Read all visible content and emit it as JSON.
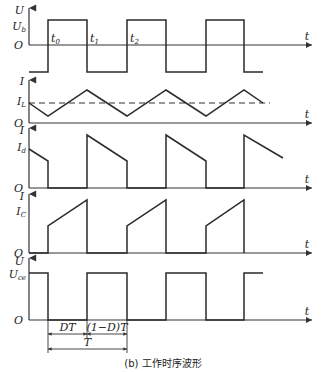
{
  "caption": "(b) 工作时序波形",
  "colors": {
    "line": "#2a2a2a",
    "background": "#ffffff"
  },
  "axis": {
    "x": 29,
    "arrow_end_x": 312,
    "time_label": "t"
  },
  "time_marks": {
    "t0": {
      "label": "t",
      "sub": "0",
      "x": 48
    },
    "t1": {
      "label": "t",
      "sub": "1",
      "x": 87
    },
    "t2": {
      "label": "t",
      "sub": "2",
      "x": 127
    }
  },
  "panels": [
    {
      "id": "U_b",
      "y_label": "U",
      "level_label": "U",
      "level_sub": "b",
      "origin_label": "O",
      "top": 8,
      "zero_y": 45,
      "label_y": 14,
      "level_y": 30,
      "points": [
        [
          29,
          72
        ],
        [
          48,
          72
        ],
        [
          48,
          20
        ],
        [
          87,
          20
        ],
        [
          87,
          72
        ],
        [
          127,
          72
        ],
        [
          127,
          20
        ],
        [
          166,
          20
        ],
        [
          166,
          72
        ],
        [
          206,
          72
        ],
        [
          206,
          20
        ],
        [
          244,
          20
        ],
        [
          244,
          72
        ],
        [
          263,
          72
        ]
      ]
    },
    {
      "id": "I_L",
      "y_label": "I",
      "level_label": "I",
      "level_sub": "L",
      "origin_label": "O",
      "top": 80,
      "zero_y": 123,
      "label_y": 85,
      "level_y": 105,
      "dashed_y": 103,
      "dashed_x_end": 270,
      "points": [
        [
          29,
          103
        ],
        [
          48,
          116
        ],
        [
          87,
          90
        ],
        [
          127,
          116
        ],
        [
          166,
          90
        ],
        [
          206,
          116
        ],
        [
          244,
          90
        ],
        [
          263,
          103
        ]
      ]
    },
    {
      "id": "I_d",
      "y_label": "I",
      "level_label": "I",
      "level_sub": "d",
      "origin_label": "O",
      "top": 128,
      "zero_y": 188,
      "label_y": 134,
      "level_y": 151,
      "points": [
        [
          29,
          149
        ],
        [
          48,
          161
        ],
        [
          48,
          188
        ],
        [
          87,
          188
        ],
        [
          87,
          135
        ],
        [
          127,
          161
        ],
        [
          127,
          188
        ],
        [
          166,
          188
        ],
        [
          166,
          135
        ],
        [
          206,
          161
        ],
        [
          206,
          188
        ],
        [
          244,
          188
        ],
        [
          244,
          135
        ],
        [
          283,
          158
        ]
      ]
    },
    {
      "id": "I_C",
      "y_label": "I",
      "level_label": "I",
      "level_sub": "C",
      "origin_label": "O",
      "top": 194,
      "zero_y": 253,
      "label_y": 200,
      "level_y": 215,
      "points": [
        [
          29,
          253
        ],
        [
          48,
          253
        ],
        [
          48,
          226
        ],
        [
          87,
          200
        ],
        [
          87,
          253
        ],
        [
          127,
          253
        ],
        [
          127,
          226
        ],
        [
          166,
          200
        ],
        [
          166,
          253
        ],
        [
          206,
          253
        ],
        [
          206,
          226
        ],
        [
          244,
          200
        ],
        [
          244,
          253
        ]
      ]
    },
    {
      "id": "U_ce",
      "y_label": "U",
      "level_label": "U",
      "level_sub": "ce",
      "origin_label": "O",
      "top": 258,
      "zero_y": 320,
      "label_y": 265,
      "level_y": 278,
      "points": [
        [
          29,
          273
        ],
        [
          48,
          273
        ],
        [
          48,
          320
        ],
        [
          87,
          320
        ],
        [
          87,
          273
        ],
        [
          127,
          273
        ],
        [
          127,
          320
        ],
        [
          166,
          320
        ],
        [
          166,
          273
        ],
        [
          206,
          273
        ],
        [
          206,
          320
        ],
        [
          244,
          320
        ],
        [
          244,
          273
        ],
        [
          263,
          273
        ]
      ]
    }
  ],
  "dimensions": {
    "dt": {
      "label": "DT",
      "x1": 48,
      "x2": 87,
      "y": 334
    },
    "one_minus_d_t": {
      "label": "(1−D)T",
      "x1": 87,
      "x2": 127,
      "y": 334
    },
    "period": {
      "label": "T",
      "x1": 48,
      "x2": 127,
      "y": 349
    }
  }
}
